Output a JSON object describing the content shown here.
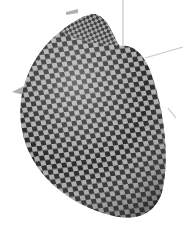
{
  "figure": {
    "type": "3d-surface-render",
    "texture": "checkerboard",
    "colors": {
      "background": "#ffffff",
      "check_dark": "#1e1e1e",
      "check_light": "#a8a8a8",
      "axis": "#c8c8c8",
      "arrow": "#b0b0b0"
    },
    "axes": [
      {
        "name": "vertical-axis"
      },
      {
        "name": "right-axis"
      },
      {
        "name": "left-axis-arrow"
      },
      {
        "name": "top-axis-arrow"
      }
    ]
  }
}
